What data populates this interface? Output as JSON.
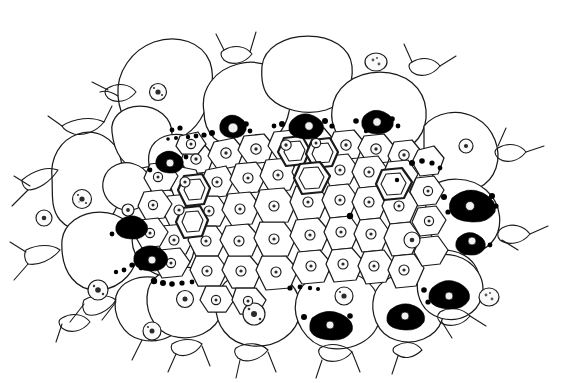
{
  "figure": {
    "domain": "Natural-Image",
    "kind": "scientific-line-drawing",
    "title": "",
    "caption": "",
    "canvas": {
      "width": 564,
      "height": 383
    },
    "background_color": "#ffffff",
    "line_color": "#1a1a1a",
    "inclusion_color": "#000000",
    "nucleus_fill": "#fbfbfb",
    "alt_text": "Black-and-white stippled line drawing of a plant tissue cross-section: a lens-shaped mass of polygonal cells, large rounded parenchyma cells with pointed intercellular spaces around the margin, a dense core of small cells each containing a stippled nucleus, several thick double-walled vessel elements near the centre, and numerous dark granule clusters pressed against cell walls."
  },
  "legend_items": [
    {
      "id": "large-parenchyma-cell",
      "label": "Large parenchyma cell",
      "count": 22
    },
    {
      "id": "small-core-cell",
      "label": "Small core cell",
      "count": 58
    },
    {
      "id": "thick-walled-vessel",
      "label": "Thick-walled vessel element",
      "count": 7
    },
    {
      "id": "nucleus",
      "label": "Nucleus with nucleolus",
      "count": 46
    },
    {
      "id": "granule-cluster",
      "label": "Dark granule cluster",
      "count": 18
    },
    {
      "id": "intercellular-space",
      "label": "Intercellular space",
      "count": 15
    },
    {
      "id": "free-body",
      "label": "Detached free body",
      "count": 2
    }
  ],
  "structures": {
    "outer_boundary": "M 14,175 C 18,150 40,128 62,126 C 78,112 96,104 112,106 C 120,82 140,56 166,48 C 190,40 214,44 228,60 C 246,44 268,34 292,36 C 314,38 330,50 336,66 C 352,54 376,52 396,62 C 418,72 432,92 436,112 C 460,108 486,116 504,134 C 526,156 538,184 534,210 C 548,228 552,252 540,270 C 528,290 504,300 482,296 C 470,318 444,332 418,328 C 400,346 370,354 344,346 C 322,362 290,366 266,354 C 244,368 212,368 192,354 C 168,364 140,358 126,340 C 104,348 78,340 68,322 C 46,322 26,306 22,284 C 8,268 4,242 12,220 C 6,204 6,188 14,175 Z"
  },
  "free_bodies": [
    {
      "id": "free-body-top",
      "cx": 376,
      "cy": 62,
      "rx": 11,
      "ry": 9
    },
    {
      "id": "free-body-right",
      "cx": 489,
      "cy": 297,
      "rx": 10,
      "ry": 9
    }
  ],
  "notes": {
    "no_text_in_image": true,
    "no_axis_or_scale_bar": true,
    "stroke_style": "hand-inked ink line, varying weight"
  }
}
